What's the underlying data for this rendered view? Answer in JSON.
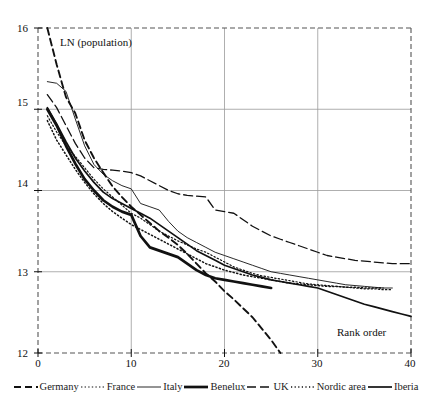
{
  "chart_data": {
    "type": "line",
    "title": "",
    "xlabel": "Rank order",
    "ylabel": "LN (population)",
    "xlim": [
      0,
      40
    ],
    "ylim": [
      12,
      16
    ],
    "xticks": [
      0,
      10,
      20,
      30,
      40
    ],
    "yticks": [
      12,
      13,
      14,
      15,
      16
    ],
    "grid": true,
    "legend_position": "below",
    "series": [
      {
        "name": "Germany",
        "style": "dashed",
        "x": [
          1,
          2,
          3,
          4,
          5,
          6,
          7,
          8,
          9,
          10,
          11,
          12,
          13,
          14,
          15,
          16,
          17,
          18,
          19,
          20,
          21,
          22,
          23,
          24,
          25,
          26
        ],
        "y": [
          16.0,
          15.55,
          15.15,
          14.95,
          14.62,
          14.4,
          14.22,
          14.05,
          13.92,
          13.8,
          13.7,
          13.6,
          13.5,
          13.42,
          13.33,
          13.22,
          13.1,
          12.98,
          12.88,
          12.76,
          12.66,
          12.55,
          12.44,
          12.3,
          12.16,
          12.0
        ]
      },
      {
        "name": "France",
        "style": "dotted",
        "x": [
          1,
          2,
          3,
          4,
          5,
          6,
          7,
          8,
          9,
          10,
          11,
          12,
          13,
          14,
          15,
          16,
          17,
          18,
          19,
          20,
          21,
          22,
          23,
          24,
          25,
          26,
          27,
          28,
          29,
          30,
          31,
          32,
          33,
          34,
          35,
          36,
          37,
          38
        ],
        "y": [
          14.92,
          14.72,
          14.55,
          14.42,
          14.28,
          14.14,
          14.02,
          13.92,
          13.82,
          13.72,
          13.66,
          13.58,
          13.5,
          13.44,
          13.38,
          13.33,
          13.28,
          13.24,
          13.18,
          13.12,
          13.06,
          13.02,
          12.98,
          12.95,
          12.93,
          12.91,
          12.89,
          12.87,
          12.85,
          12.84,
          12.83,
          12.82,
          12.81,
          12.8,
          12.79,
          12.79,
          12.78,
          12.78
        ]
      },
      {
        "name": "Italy",
        "style": "thin-solid",
        "x": [
          1,
          2,
          3,
          4,
          5,
          6,
          7,
          8,
          9,
          10,
          11,
          12,
          13,
          14,
          15,
          16,
          17,
          18,
          19,
          20,
          21,
          22,
          23,
          24,
          25,
          26,
          27,
          28,
          29,
          30,
          31,
          32,
          33,
          34,
          35,
          36,
          37,
          38
        ],
        "y": [
          15.34,
          15.32,
          15.22,
          14.88,
          14.55,
          14.32,
          14.2,
          14.12,
          14.06,
          14.02,
          13.84,
          13.8,
          13.76,
          13.62,
          13.5,
          13.42,
          13.36,
          13.3,
          13.24,
          13.2,
          13.16,
          13.12,
          13.08,
          13.04,
          13.0,
          12.98,
          12.96,
          12.94,
          12.92,
          12.9,
          12.88,
          12.86,
          12.84,
          12.83,
          12.82,
          12.81,
          12.8,
          12.8
        ]
      },
      {
        "name": "Benelux",
        "style": "thick-solid",
        "x": [
          1,
          2,
          3,
          4,
          5,
          6,
          7,
          8,
          9,
          10,
          11,
          12,
          13,
          14,
          15,
          16,
          17,
          18,
          19,
          20,
          21,
          22,
          23,
          24,
          25
        ],
        "y": [
          15.0,
          14.8,
          14.55,
          14.33,
          14.14,
          14.0,
          13.88,
          13.8,
          13.74,
          13.7,
          13.44,
          13.3,
          13.26,
          13.22,
          13.18,
          13.1,
          13.02,
          12.96,
          12.92,
          12.9,
          12.88,
          12.86,
          12.84,
          12.82,
          12.8
        ]
      },
      {
        "name": "UK",
        "style": "long-dash",
        "x": [
          1,
          2,
          3,
          4,
          5,
          6,
          7,
          8,
          9,
          10,
          11,
          12,
          13,
          14,
          15,
          16,
          17,
          18,
          19,
          20,
          21,
          22,
          23,
          24,
          25,
          26,
          27,
          28,
          29,
          30,
          31,
          32,
          33,
          34,
          35,
          36,
          37,
          38,
          39,
          40
        ],
        "y": [
          15.18,
          15.02,
          14.8,
          14.58,
          14.4,
          14.28,
          14.26,
          14.25,
          14.24,
          14.22,
          14.18,
          14.12,
          14.06,
          14.0,
          13.96,
          13.94,
          13.93,
          13.92,
          13.76,
          13.74,
          13.72,
          13.64,
          13.56,
          13.5,
          13.44,
          13.4,
          13.36,
          13.32,
          13.28,
          13.24,
          13.2,
          13.18,
          13.16,
          13.14,
          13.13,
          13.12,
          13.11,
          13.1,
          13.1,
          13.1
        ]
      },
      {
        "name": "Nordic area",
        "style": "fine-dotted",
        "x": [
          1,
          2,
          3,
          4,
          5,
          6,
          7,
          8,
          9,
          10,
          11,
          12,
          13,
          14,
          15,
          16,
          17,
          18,
          19,
          20,
          21,
          22,
          23,
          24,
          25,
          26,
          27,
          28,
          29,
          30,
          31,
          32,
          33,
          34,
          35,
          36,
          37
        ],
        "y": [
          14.86,
          14.62,
          14.44,
          14.26,
          14.1,
          13.96,
          13.84,
          13.74,
          13.66,
          13.58,
          13.52,
          13.46,
          13.4,
          13.34,
          13.28,
          13.22,
          13.16,
          13.1,
          13.06,
          13.02,
          12.99,
          12.96,
          12.94,
          12.92,
          12.9,
          12.88,
          12.86,
          12.85,
          12.84,
          12.83,
          12.82,
          12.82,
          12.81,
          12.81,
          12.8,
          12.8,
          12.8
        ]
      },
      {
        "name": "Iberia",
        "style": "solid",
        "x": [
          1,
          2,
          3,
          4,
          5,
          6,
          7,
          8,
          9,
          10,
          11,
          12,
          13,
          14,
          15,
          16,
          17,
          18,
          19,
          20,
          21,
          22,
          23,
          24,
          25,
          26,
          27,
          28,
          29,
          30,
          31,
          32,
          33,
          34,
          35,
          36,
          37,
          38,
          39,
          40
        ],
        "y": [
          15.02,
          14.82,
          14.6,
          14.4,
          14.24,
          14.1,
          13.98,
          13.9,
          13.84,
          13.78,
          13.72,
          13.66,
          13.58,
          13.5,
          13.42,
          13.34,
          13.26,
          13.2,
          13.14,
          13.08,
          13.04,
          13.0,
          12.96,
          12.93,
          12.9,
          12.88,
          12.86,
          12.84,
          12.82,
          12.8,
          12.76,
          12.72,
          12.68,
          12.64,
          12.6,
          12.57,
          12.54,
          12.51,
          12.48,
          12.45
        ]
      }
    ]
  },
  "axis": {
    "y_labels": [
      "16",
      "15",
      "14",
      "13",
      "12"
    ],
    "x_labels": [
      "0",
      "10",
      "20",
      "30",
      "40"
    ],
    "y_title": "LN (population)",
    "x_title": "Rank order"
  },
  "legend": {
    "items": [
      {
        "label": "Germany",
        "style": "dashed"
      },
      {
        "label": "France",
        "style": "dotted"
      },
      {
        "label": "Italy",
        "style": "thin-solid"
      },
      {
        "label": "Benelux",
        "style": "thick-solid"
      },
      {
        "label": "UK",
        "style": "long-dash"
      },
      {
        "label": "Nordic area",
        "style": "fine-dotted"
      },
      {
        "label": "Iberia",
        "style": "solid"
      }
    ]
  },
  "colors": {
    "ink": "#111111",
    "grid": "#9a9a9a",
    "frame": "#555555",
    "background": "#ffffff"
  }
}
